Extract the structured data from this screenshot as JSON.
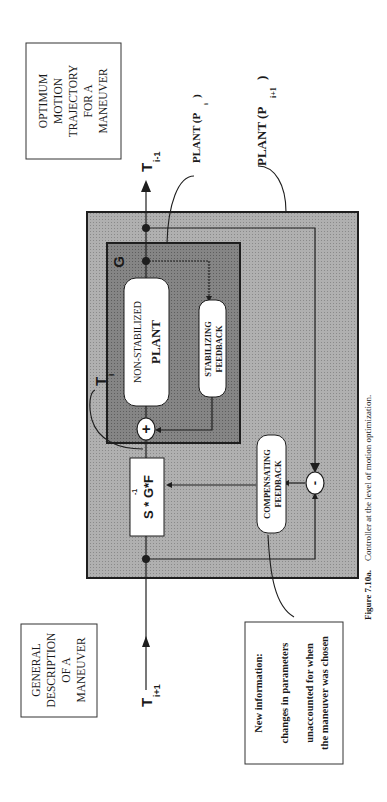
{
  "figure": {
    "caption_label": "Figure 7.10a.",
    "caption_text": "Controller at the level of motion optimization."
  },
  "boxes": {
    "optimum": {
      "lines": [
        "OPTIMUM",
        "MOTION",
        "TRAJECTORY",
        "FOR A",
        "MANEUVER"
      ]
    },
    "general": {
      "lines": [
        "GENERAL",
        "DESCRIPTION",
        "OF A",
        "MANEUVER"
      ]
    },
    "new_info": {
      "lines": [
        "New information:",
        "changes in parameters",
        "unaccounted for when",
        "the maneuver was chosen"
      ]
    },
    "g_block": {
      "label": "G"
    },
    "plant": {
      "line1": "NON-STABILIZED",
      "line2": "PLANT"
    },
    "stabilizing": {
      "line1": "STABILIZING",
      "line2": "FEEDBACK"
    },
    "compensating": {
      "line1": "COMPENSATING",
      "line2": "FEEDBACK"
    },
    "sgf": {
      "label": "S * G*F",
      "superscript": "-1"
    }
  },
  "junctions": {
    "sum_plus": "+",
    "sum_minus": "-"
  },
  "signals": {
    "t_prev": {
      "base": "T",
      "sub": "i-1"
    },
    "t_curr": {
      "base": "T",
      "sub": "i"
    },
    "t_next": {
      "base": "T",
      "sub": "i+1"
    },
    "plant_i": {
      "base": "PLANT (P",
      "sub": "i",
      "close": ")"
    },
    "plant_i1": {
      "base": "PLANT (P",
      "sub": "i+1",
      "close": ")"
    }
  },
  "colors": {
    "outer_fill": "#a9a9a9",
    "inner_fill": "#7f7f7f",
    "line": "#1e1e1e",
    "box_fill": "#ffffff"
  }
}
